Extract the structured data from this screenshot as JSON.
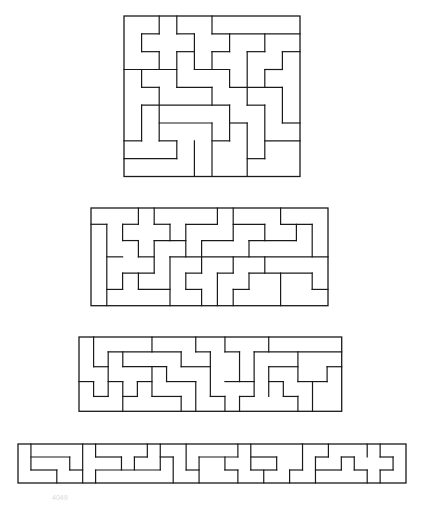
{
  "figure": {
    "title": "",
    "stroke_color": "#1a1a1a",
    "background": "#ffffff",
    "caption": "4049"
  },
  "tilings": [
    {
      "name": "tiling-10x9",
      "cols": 10,
      "rows": 9,
      "box": {
        "x": 124,
        "y": 15.5,
        "w": 176,
        "h": 160.5
      },
      "h_segments": [
        [
          1,
          1,
          2
        ],
        [
          1,
          3,
          4
        ],
        [
          1,
          5,
          10
        ],
        [
          2,
          1,
          2
        ],
        [
          2,
          3,
          4
        ],
        [
          2,
          5,
          6
        ],
        [
          2,
          7,
          8
        ],
        [
          2,
          9,
          10
        ],
        [
          3,
          0,
          3
        ],
        [
          3,
          4,
          6
        ],
        [
          3,
          8,
          9
        ],
        [
          4,
          1,
          2
        ],
        [
          4,
          3,
          5
        ],
        [
          4,
          6,
          9
        ],
        [
          5,
          1,
          6
        ],
        [
          5,
          7,
          8
        ],
        [
          6,
          2,
          5
        ],
        [
          6,
          6,
          7
        ],
        [
          6,
          9,
          10
        ],
        [
          7,
          0,
          1
        ],
        [
          7,
          2,
          3
        ],
        [
          7,
          5,
          6
        ],
        [
          7,
          8,
          10
        ],
        [
          8,
          0,
          3
        ],
        [
          8,
          7,
          8
        ]
      ],
      "v_segments": [
        [
          1,
          1,
          2
        ],
        [
          1,
          3,
          4
        ],
        [
          1,
          5,
          7
        ],
        [
          2,
          0,
          1
        ],
        [
          2,
          2,
          3
        ],
        [
          2,
          4,
          7
        ],
        [
          3,
          0,
          1
        ],
        [
          3,
          2,
          4
        ],
        [
          3,
          7,
          8
        ],
        [
          4,
          1,
          3
        ],
        [
          4,
          7,
          9
        ],
        [
          5,
          0,
          1
        ],
        [
          5,
          2,
          3
        ],
        [
          5,
          4,
          5
        ],
        [
          5,
          6,
          9
        ],
        [
          6,
          1,
          2
        ],
        [
          6,
          3,
          4
        ],
        [
          6,
          5,
          7
        ],
        [
          7,
          2,
          5
        ],
        [
          7,
          6,
          9
        ],
        [
          8,
          1,
          2
        ],
        [
          8,
          3,
          4
        ],
        [
          8,
          5,
          8
        ],
        [
          9,
          2,
          3
        ],
        [
          9,
          4,
          6
        ]
      ]
    },
    {
      "name": "tiling-15x6",
      "cols": 15,
      "rows": 6,
      "box": {
        "x": 91,
        "y": 208.3,
        "w": 237,
        "h": 97.7
      },
      "h_segments": [
        [
          1,
          0,
          1
        ],
        [
          1,
          2,
          3
        ],
        [
          1,
          4,
          5
        ],
        [
          1,
          6,
          8
        ],
        [
          1,
          9,
          11
        ],
        [
          1,
          12,
          14
        ],
        [
          2,
          2,
          3
        ],
        [
          2,
          4,
          6
        ],
        [
          2,
          7,
          9
        ],
        [
          2,
          10,
          13
        ],
        [
          3,
          1,
          2
        ],
        [
          3,
          3,
          4
        ],
        [
          3,
          5,
          15
        ],
        [
          4,
          2,
          4
        ],
        [
          4,
          6,
          7
        ],
        [
          4,
          8,
          9
        ],
        [
          4,
          10,
          14
        ],
        [
          5,
          1,
          2
        ],
        [
          5,
          3,
          5
        ],
        [
          5,
          6,
          7
        ],
        [
          5,
          9,
          10
        ],
        [
          5,
          14,
          15
        ]
      ],
      "v_segments": [
        [
          1,
          1,
          6
        ],
        [
          2,
          1,
          2
        ],
        [
          2,
          4,
          5
        ],
        [
          3,
          0,
          1
        ],
        [
          3,
          2,
          3
        ],
        [
          3,
          4,
          5
        ],
        [
          4,
          0,
          1
        ],
        [
          4,
          2,
          4
        ],
        [
          5,
          1,
          2
        ],
        [
          5,
          3,
          6
        ],
        [
          6,
          1,
          3
        ],
        [
          6,
          4,
          5
        ],
        [
          7,
          2,
          4
        ],
        [
          7,
          5,
          6
        ],
        [
          8,
          0,
          1
        ],
        [
          8,
          4,
          6
        ],
        [
          9,
          0,
          2
        ],
        [
          9,
          3,
          4
        ],
        [
          9,
          5,
          6
        ],
        [
          10,
          2,
          3
        ],
        [
          10,
          4,
          5
        ],
        [
          11,
          1,
          2
        ],
        [
          11,
          3,
          4
        ],
        [
          12,
          0,
          1
        ],
        [
          12,
          4,
          6
        ],
        [
          13,
          1,
          2
        ],
        [
          14,
          1,
          3
        ],
        [
          14,
          4,
          5
        ]
      ]
    },
    {
      "name": "tiling-18x5",
      "cols": 18,
      "rows": 5,
      "box": {
        "x": 79,
        "y": 336.7,
        "w": 262.7,
        "h": 74.3
      },
      "h_segments": [
        [
          1,
          2,
          7
        ],
        [
          1,
          8,
          9
        ],
        [
          1,
          10,
          11
        ],
        [
          1,
          12,
          18
        ],
        [
          2,
          1,
          2
        ],
        [
          2,
          3,
          6
        ],
        [
          2,
          7,
          9
        ],
        [
          2,
          13,
          15
        ],
        [
          2,
          17,
          18
        ],
        [
          3,
          0,
          1
        ],
        [
          3,
          2,
          3
        ],
        [
          3,
          4,
          5
        ],
        [
          3,
          6,
          8
        ],
        [
          3,
          10,
          12
        ],
        [
          3,
          13,
          14
        ],
        [
          3,
          15,
          17
        ],
        [
          4,
          1,
          2
        ],
        [
          4,
          3,
          4
        ],
        [
          4,
          5,
          7
        ],
        [
          4,
          9,
          10
        ],
        [
          4,
          11,
          12
        ],
        [
          4,
          14,
          15
        ]
      ],
      "v_segments": [
        [
          1,
          0,
          2
        ],
        [
          1,
          3,
          4
        ],
        [
          2,
          1,
          4
        ],
        [
          3,
          1,
          2
        ],
        [
          3,
          3,
          5
        ],
        [
          4,
          3,
          4
        ],
        [
          5,
          0,
          1
        ],
        [
          5,
          2,
          4
        ],
        [
          6,
          2,
          3
        ],
        [
          7,
          1,
          2
        ],
        [
          7,
          4,
          5
        ],
        [
          8,
          0,
          1
        ],
        [
          8,
          3,
          5
        ],
        [
          9,
          1,
          4
        ],
        [
          10,
          0,
          1
        ],
        [
          10,
          4,
          5
        ],
        [
          11,
          1,
          3
        ],
        [
          11,
          4,
          5
        ],
        [
          12,
          1,
          4
        ],
        [
          13,
          0,
          1
        ],
        [
          13,
          2,
          4
        ],
        [
          14,
          3,
          4
        ],
        [
          15,
          1,
          3
        ],
        [
          15,
          4,
          5
        ],
        [
          16,
          3,
          5
        ],
        [
          17,
          2,
          3
        ]
      ]
    },
    {
      "name": "tiling-30x3",
      "cols": 30,
      "rows": 3,
      "box": {
        "x": 18.3,
        "y": 444.3,
        "w": 388,
        "h": 39
      },
      "h_segments": [
        [
          1,
          1,
          4
        ],
        [
          1,
          6,
          8
        ],
        [
          1,
          9,
          10
        ],
        [
          1,
          11,
          12
        ],
        [
          1,
          14,
          17
        ],
        [
          1,
          18,
          20
        ],
        [
          1,
          23,
          24
        ],
        [
          1,
          25,
          26
        ],
        [
          1,
          28,
          29
        ],
        [
          2,
          1,
          3
        ],
        [
          2,
          4,
          5
        ],
        [
          2,
          6,
          11
        ],
        [
          2,
          13,
          14
        ],
        [
          2,
          16,
          17
        ],
        [
          2,
          18,
          20
        ],
        [
          2,
          21,
          22
        ],
        [
          2,
          23,
          25
        ],
        [
          2,
          26,
          27
        ],
        [
          2,
          28,
          29
        ]
      ],
      "v_segments": [
        [
          1,
          0,
          2
        ],
        [
          3,
          2,
          3
        ],
        [
          4,
          1,
          2
        ],
        [
          5,
          0,
          3
        ],
        [
          6,
          0,
          1
        ],
        [
          6,
          2,
          3
        ],
        [
          8,
          1,
          2
        ],
        [
          9,
          1,
          2
        ],
        [
          10,
          0,
          1
        ],
        [
          11,
          0,
          2
        ],
        [
          12,
          1,
          3
        ],
        [
          13,
          0,
          2
        ],
        [
          14,
          1,
          3
        ],
        [
          16,
          1,
          2
        ],
        [
          17,
          0,
          1
        ],
        [
          17,
          2,
          3
        ],
        [
          18,
          0,
          2
        ],
        [
          19,
          2,
          3
        ],
        [
          20,
          1,
          2
        ],
        [
          21,
          2,
          3
        ],
        [
          22,
          0,
          2
        ],
        [
          23,
          1,
          3
        ],
        [
          24,
          0,
          1
        ],
        [
          25,
          1,
          2
        ],
        [
          26,
          1,
          2
        ],
        [
          27,
          0,
          1
        ],
        [
          27,
          2,
          3
        ],
        [
          28,
          0,
          1
        ],
        [
          28,
          2,
          3
        ],
        [
          29,
          1,
          2
        ]
      ]
    }
  ]
}
